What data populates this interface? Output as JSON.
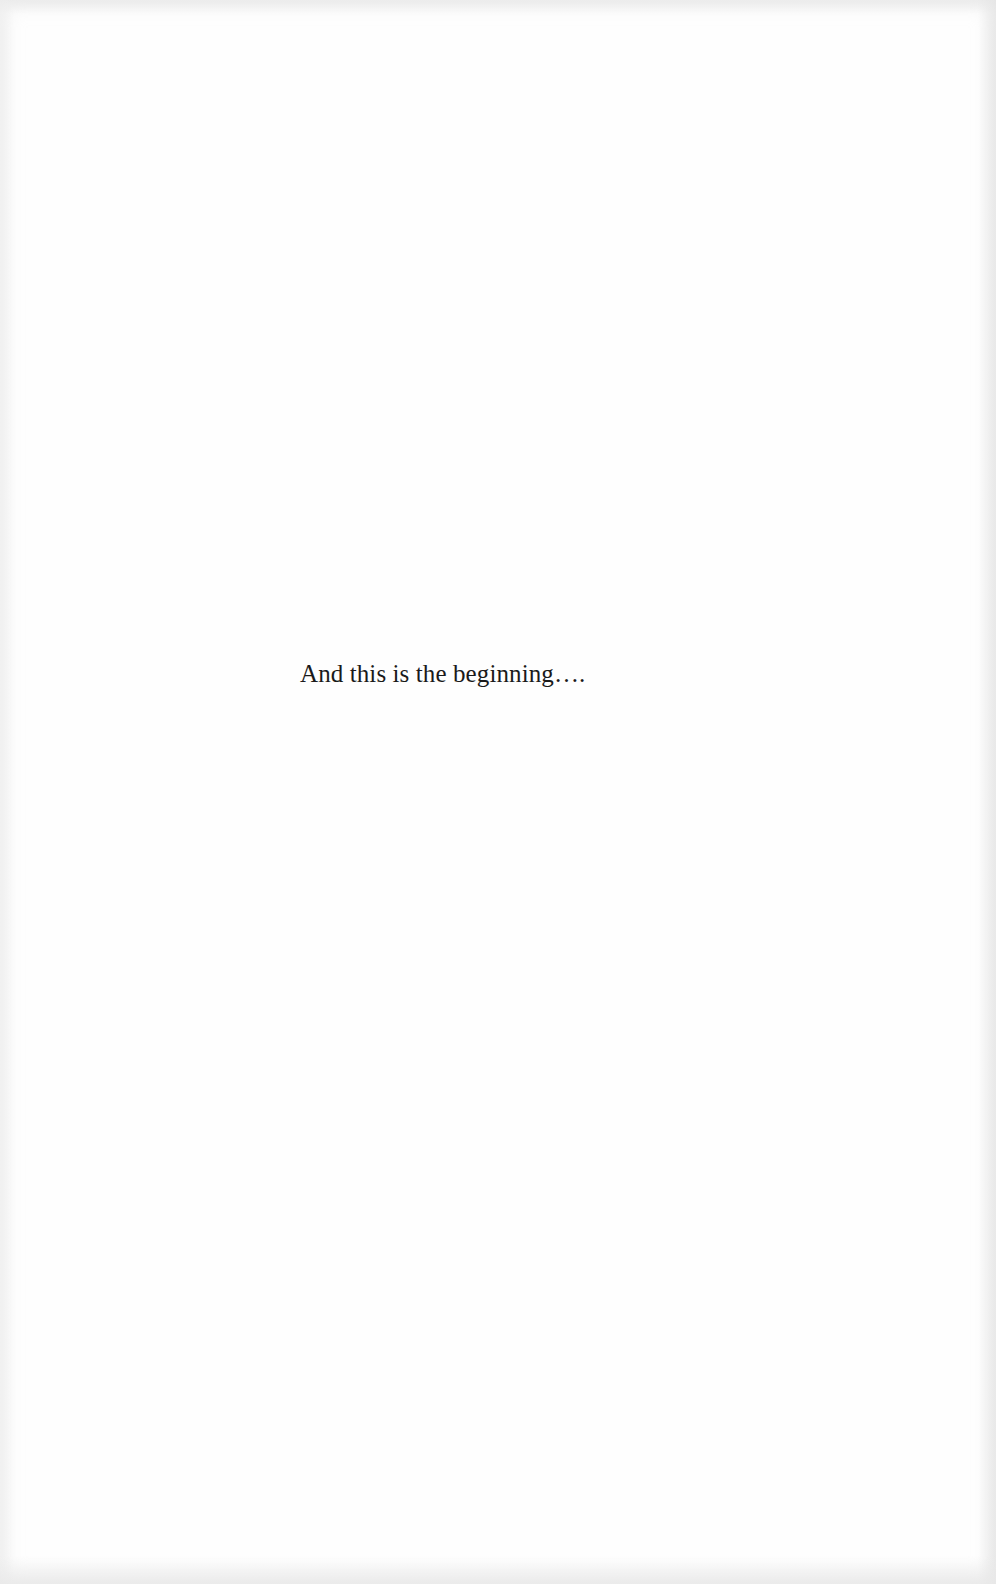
{
  "page": {
    "text": "And this is the beginning…."
  }
}
